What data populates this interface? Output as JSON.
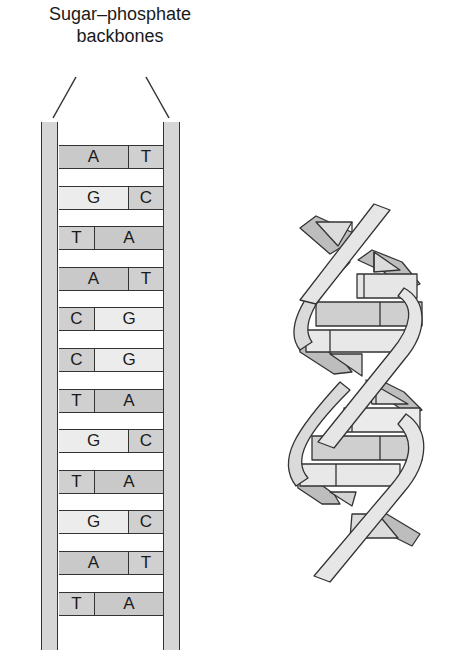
{
  "title_lines": [
    "Sugar–phosphate",
    "backbones"
  ],
  "colors": {
    "A": "#c9c9c9",
    "T": "#d0d0d0",
    "G": "#ececec",
    "C": "#d0d0d0",
    "backbone": "#d6d6d6",
    "stroke": "#333333"
  },
  "ladder": {
    "base_pairs": [
      {
        "left": "A",
        "right": "T"
      },
      {
        "left": "G",
        "right": "C"
      },
      {
        "left": "T",
        "right": "A"
      },
      {
        "left": "A",
        "right": "T"
      },
      {
        "left": "C",
        "right": "G"
      },
      {
        "left": "C",
        "right": "G"
      },
      {
        "left": "T",
        "right": "A"
      },
      {
        "left": "G",
        "right": "C"
      },
      {
        "left": "T",
        "right": "A"
      },
      {
        "left": "G",
        "right": "C"
      },
      {
        "left": "A",
        "right": "T"
      },
      {
        "left": "T",
        "right": "A"
      }
    ]
  },
  "helix": {
    "description": "double-helix illustration"
  }
}
